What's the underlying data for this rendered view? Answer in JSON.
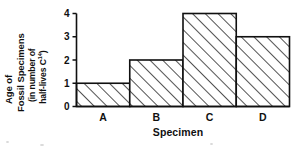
{
  "chart_data": {
    "type": "bar",
    "title": "",
    "categories": [
      "A",
      "B",
      "C",
      "D"
    ],
    "values": [
      1,
      2,
      4,
      3
    ],
    "series": [
      {
        "name": "Age of Fossil Specimens",
        "values": [
          1,
          2,
          4,
          3
        ]
      }
    ],
    "xlabel": "Specimen",
    "ylabel_lines": [
      "Age of",
      "Fossil Specimens",
      "(in number of",
      "half-lives C"
    ],
    "ylabel_superscript": "14",
    "ylabel_suffix": ")",
    "ylabel_full": "Age of Fossil Specimens (in number of half-lives C14)",
    "ytick_labels": [
      "0",
      "1",
      "2",
      "3",
      "4"
    ],
    "ytick_values": [
      0,
      1,
      2,
      3,
      4
    ],
    "ylim": [
      0,
      4
    ],
    "grid": false,
    "legend": null,
    "bar_style": "diagonal-hatch",
    "bar_gap": 0,
    "colors": {
      "axis": "#101010",
      "bar_outline": "#101010",
      "bar_fill": "#ffffff",
      "hatch": "#101010",
      "background": "#ffffff",
      "text": "#101010"
    }
  },
  "axis": {
    "y_ticks": [
      {
        "label": "4",
        "value": 4
      },
      {
        "label": "3",
        "value": 3
      },
      {
        "label": "2",
        "value": 2
      },
      {
        "label": "1",
        "value": 1
      },
      {
        "label": "0",
        "value": 0
      }
    ],
    "x_categories": [
      {
        "label": "A",
        "value": 1
      },
      {
        "label": "B",
        "value": 2
      },
      {
        "label": "C",
        "value": 4
      },
      {
        "label": "D",
        "value": 3
      }
    ]
  },
  "xaxis_title": "Specimen"
}
